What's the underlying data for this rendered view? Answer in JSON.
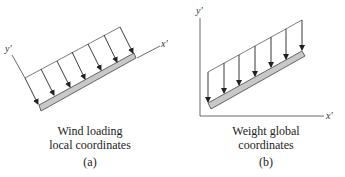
{
  "panels": [
    {
      "id": "a",
      "caption_line1": "Wind loading",
      "caption_line2": "local coordinates",
      "tag": "(a)",
      "x_axis_label": "x'",
      "y_axis_label": "y'",
      "arrow_count": 7,
      "load_direction": "perpendicular to member (local coordinates)"
    },
    {
      "id": "b",
      "caption_line1": "Weight global",
      "caption_line2": "coordinates",
      "tag": "(b)",
      "x_axis_label": "x'",
      "y_axis_label": "y'",
      "arrow_count": 7,
      "load_direction": "vertical (global coordinates)"
    }
  ],
  "colors": {
    "line": "#333333",
    "member_fill": "#c8c8c8",
    "member_stroke": "#444444",
    "background": "#ffffff"
  }
}
